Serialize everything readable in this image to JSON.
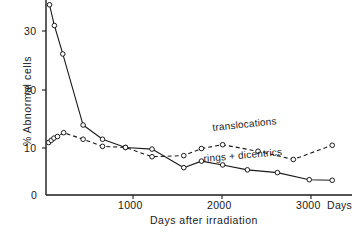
{
  "chart_data": {
    "type": "line",
    "title": "",
    "xlabel": "Days after irradiation",
    "ylabel": "% Abnormal cells",
    "x_unit_label": "Days",
    "xlim": [
      0,
      3400
    ],
    "ylim": [
      0,
      36
    ],
    "grid": false,
    "legend": "inline-annotations",
    "xticks": [
      0,
      1000,
      2000,
      3000
    ],
    "xtick_labels": [
      "0",
      "1000",
      "2000",
      "3000"
    ],
    "yticks": [
      0,
      10,
      20,
      30
    ],
    "ytick_labels": [
      "0",
      "10",
      "20",
      "30"
    ],
    "series": [
      {
        "name": "rings + dicentrics",
        "style": "solid",
        "marker": "open-circle",
        "x": [
          40,
          95,
          190,
          420,
          640,
          900,
          1200,
          1560,
          1760,
          2000,
          2280,
          2620,
          2980,
          3240
        ],
        "y": [
          34.8,
          31.0,
          25.8,
          12.8,
          10.2,
          8.7,
          8.4,
          5.0,
          6.2,
          5.5,
          4.6,
          4.1,
          2.8,
          2.7
        ]
      },
      {
        "name": "translocations",
        "style": "dashed",
        "marker": "open-circle",
        "x": [
          30,
          60,
          90,
          130,
          200,
          420,
          640,
          900,
          1200,
          1560,
          1760,
          2000,
          2400,
          2800,
          3240
        ],
        "y": [
          9.6,
          10.0,
          10.4,
          10.7,
          11.4,
          10.2,
          8.9,
          8.7,
          7.0,
          7.2,
          8.5,
          9.2,
          8.0,
          6.5,
          9.1
        ]
      }
    ],
    "annotations": [
      {
        "text": "translocations",
        "series": "translocations"
      },
      {
        "text": "rings + dicentrics",
        "series": "rings + dicentrics"
      }
    ]
  },
  "axes": {
    "y_axis_title": "% Abnormal cells",
    "x_axis_title": "Days after irradiation",
    "x_unit": "Days",
    "y_tick_30": "30",
    "y_tick_20": "20",
    "y_tick_10": "10",
    "y_tick_0": "0",
    "x_tick_1000": "1000",
    "x_tick_2000": "2000",
    "x_tick_3000": "3000"
  },
  "labels": {
    "translocations": "translocations",
    "rings_dicentrics": "rings + dicentrics"
  },
  "colors": {
    "ink": "#1a1a1a",
    "background": "#ffffff"
  }
}
